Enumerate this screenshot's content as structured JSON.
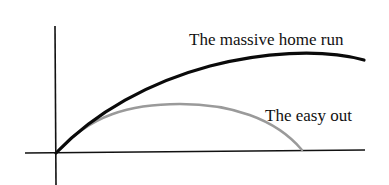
{
  "diagram": {
    "labels": {
      "home_run": "The massive home run",
      "easy_out": "The easy out"
    },
    "axes": {
      "origin": [
        56,
        153
      ],
      "x_axis": {
        "from": [
          25,
          153
        ],
        "to": [
          365,
          150
        ]
      },
      "y_axis": {
        "from": [
          55,
          26
        ],
        "to": [
          56,
          185
        ]
      }
    },
    "curves": [
      {
        "name": "The massive home run",
        "color": "#0a0a0a",
        "stroke_width": 3.2,
        "path": "M56,153 C95,112 150,82 210,66 C260,53 320,48 364,60"
      },
      {
        "name": "The easy out",
        "color": "#9a9a9a",
        "stroke_width": 2.4,
        "path": "M56,153 C90,115 130,104 180,104 C230,104 275,118 302,150"
      }
    ],
    "colors": {
      "axis": "#111111",
      "background": "#ffffff"
    }
  }
}
